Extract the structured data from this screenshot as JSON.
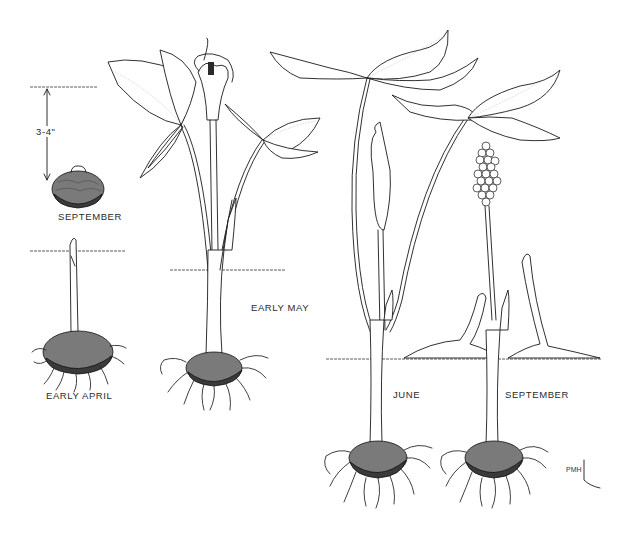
{
  "figure": {
    "depth_marker": {
      "label": "3-4\""
    },
    "stages": [
      {
        "id": "dormant-corm",
        "label": "SEPTEMBER"
      },
      {
        "id": "sprouting",
        "label": "EARLY APRIL"
      },
      {
        "id": "flowering",
        "label": "EARLY MAY"
      },
      {
        "id": "fruit-forming",
        "label": "JUNE"
      },
      {
        "id": "fruit-ripe",
        "label": "SEPTEMBER"
      }
    ],
    "signature": "PMH"
  }
}
